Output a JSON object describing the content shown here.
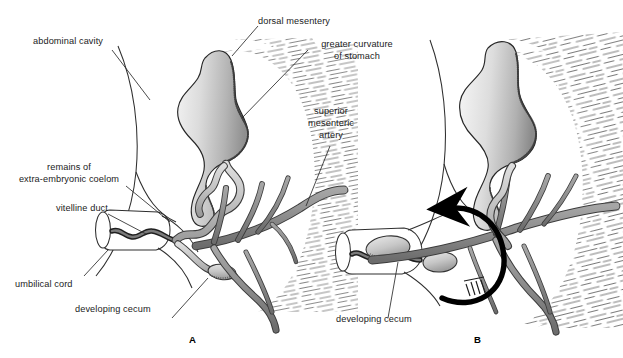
{
  "figure": {
    "title_absent": true,
    "panels": [
      {
        "id": "A",
        "caption": "A",
        "labels": [
          {
            "name": "abdominal-cavity",
            "text": "abdominal cavity"
          },
          {
            "name": "remains-of-extra-embryonic-coelom",
            "line1": "remains of",
            "line2": "extra-embryonic coelom"
          },
          {
            "name": "vitelline-duct",
            "text": "vitelline duct"
          },
          {
            "name": "umbilical-cord",
            "text": "umbilical cord"
          },
          {
            "name": "developing-cecum",
            "text": "developing cecum"
          },
          {
            "name": "dorsal-mesentery",
            "text": "dorsal mesentery"
          },
          {
            "name": "greater-curvature-of-stomach",
            "line1": "greater curvature",
            "line2": "of stomach"
          },
          {
            "name": "superior-mesenteric-artery",
            "line1": "superior",
            "line2": "mesenteric",
            "line3": "artery"
          }
        ]
      },
      {
        "id": "B",
        "caption": "B",
        "labels": [
          {
            "name": "developing-cecum",
            "text": "developing cecum"
          }
        ],
        "annotation": {
          "name": "rotation-arrow",
          "meaning": "counterclockwise rotation of intestinal loop"
        }
      }
    ]
  },
  "colors": {
    "ink": "#1b1b1b",
    "outline": "#2b2b2b",
    "vessel_fill": "#8e8e8e",
    "vessel_dark": "#6f6f6f",
    "organ_light": "#e2e2e2",
    "organ_mid": "#bdbdbd",
    "organ_dark": "#8c8c8c",
    "hatch": "#3a3a3a",
    "background": "#ffffff",
    "arrow": "#000000"
  },
  "labels_flat": {
    "abdominal_cavity": "abdominal cavity",
    "remains_of": "remains of",
    "extra_embryonic_coelom": "extra-embryonic coelom",
    "vitelline_duct": "vitelline duct",
    "umbilical_cord": "umbilical cord",
    "developing_cecum_a": "developing cecum",
    "developing_cecum_b": "developing cecum",
    "dorsal_mesentery": "dorsal mesentery",
    "greater_curvature": "greater curvature",
    "of_stomach": "of stomach",
    "superior": "superior",
    "mesenteric": "mesenteric",
    "artery": "artery",
    "caption_a": "A",
    "caption_b": "B"
  }
}
